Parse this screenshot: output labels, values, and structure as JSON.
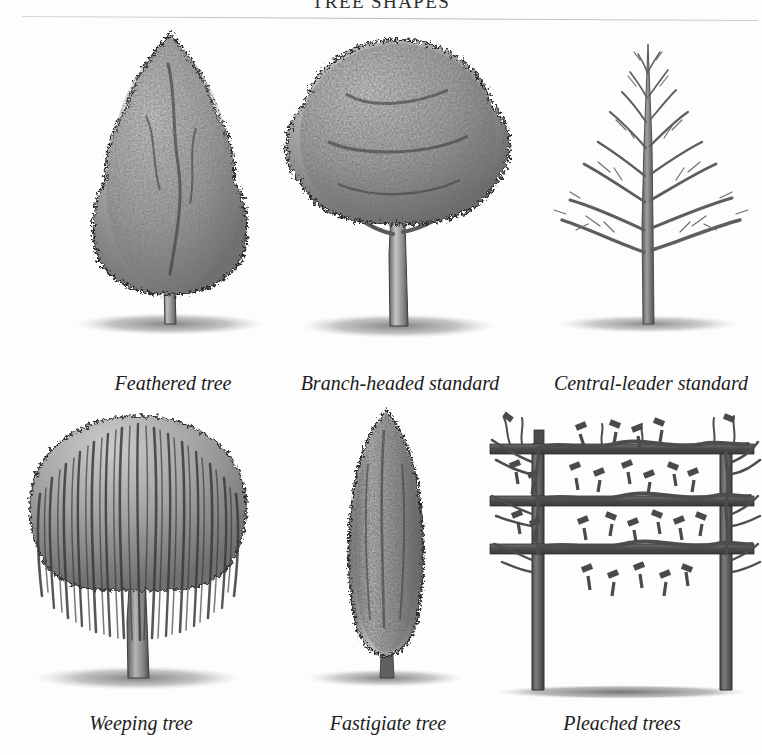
{
  "page": {
    "title": "TREE SHAPES",
    "background_color": "#fdfdfd",
    "text_color": "#1a1a1a",
    "foliage_gray": "#9a9a9a",
    "ink_gray": "#4a4a4a",
    "shadow_gray": "#8d8d8d"
  },
  "figures": [
    {
      "id": "feathered-tree",
      "caption": "Feathered tree",
      "form": "conical canopy clothed in foliage to near ground level on a single stem"
    },
    {
      "id": "branch-headed-standard",
      "caption": "Branch-headed standard",
      "form": "rounded spreading head of branches on a clear trunk"
    },
    {
      "id": "central-leader-standard",
      "caption": "Central-leader standard",
      "form": "bare winter tree with one dominant vertical leader and tiered lateral branches"
    },
    {
      "id": "weeping-tree",
      "caption": "Weeping tree",
      "form": "domed crown with long pendulous shoots cascading downward"
    },
    {
      "id": "fastigiate-tree",
      "caption": "Fastigiate tree",
      "form": "narrow columnar habit with erect branches held close to the stem"
    },
    {
      "id": "pleached-trees",
      "caption": "Pleached trees",
      "form": "two clear trunks with branches trained horizontally along three tiers, pruned shoots showing"
    }
  ]
}
